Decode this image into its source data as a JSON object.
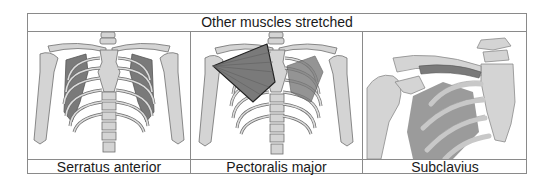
{
  "table": {
    "header": "Other muscles stretched",
    "columns": [
      {
        "label": "Serratus anterior",
        "image": "ribcage-front-serratus-anterior-illustration"
      },
      {
        "label": "Pectoralis major",
        "image": "ribcage-front-pectoralis-major-illustration"
      },
      {
        "label": "Subclavius",
        "image": "shoulder-clavicle-subclavius-illustration"
      }
    ]
  },
  "colors": {
    "bone": "#d4d4d4",
    "bone_outline": "#6e6e6e",
    "muscle": "#7a7a7a",
    "muscle_dark": "#555555",
    "border": "#8a8a8a",
    "text": "#1a1a1a"
  }
}
